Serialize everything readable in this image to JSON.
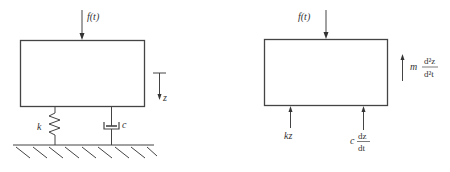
{
  "left_diagram": {
    "title": "spring-damper-mass system",
    "force_label": "f(t)",
    "displacement_label": "z",
    "spring_label": "k",
    "damper_label": "c"
  },
  "right_diagram": {
    "title": "free body diagram",
    "force_label": "f(t)",
    "inertia_coef": "m",
    "inertia_num": "d²z",
    "inertia_den": "d²t",
    "spring_force_label": "kz",
    "damper_coef": "c",
    "damper_num": "dz",
    "damper_den": "dt"
  },
  "colors": {
    "stroke": "#444444",
    "text": "#333333",
    "background": "#ffffff"
  }
}
